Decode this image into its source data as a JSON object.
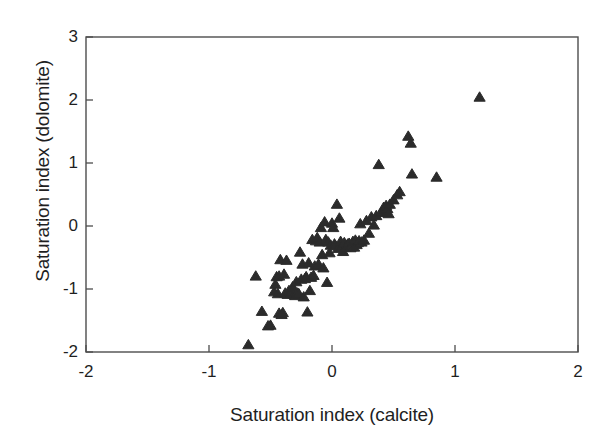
{
  "chart_data": {
    "type": "scatter",
    "title": "",
    "xlabel": "Saturation index (calcite)",
    "ylabel": "Saturation index (dolomite)",
    "xlim": [
      -2,
      2
    ],
    "ylim": [
      -2,
      3
    ],
    "xticks": [
      -2,
      -1,
      0,
      1,
      2
    ],
    "yticks": [
      -2,
      -1,
      0,
      1,
      2,
      3
    ],
    "xtick_labels": [
      "-2",
      "-1",
      "0",
      "1",
      "2"
    ],
    "ytick_labels": [
      "-2",
      "-1",
      "0",
      "1",
      "2",
      "3"
    ],
    "grid": false,
    "legend": null,
    "marker": "triangle-up",
    "marker_color": "#2b2b2b",
    "marker_size": 7,
    "frame": true,
    "series": [
      {
        "name": "samples",
        "points": [
          [
            -0.68,
            -1.88
          ],
          [
            -0.62,
            -0.79
          ],
          [
            -0.57,
            -1.35
          ],
          [
            -0.52,
            -1.58
          ],
          [
            -0.5,
            -1.57
          ],
          [
            -0.47,
            -1.04
          ],
          [
            -0.46,
            -0.92
          ],
          [
            -0.45,
            -0.8
          ],
          [
            -0.44,
            -1.07
          ],
          [
            -0.43,
            -0.79
          ],
          [
            -0.43,
            -1.38
          ],
          [
            -0.42,
            -0.53
          ],
          [
            -0.41,
            -1.4
          ],
          [
            -0.4,
            -1.37
          ],
          [
            -0.39,
            -0.76
          ],
          [
            -0.38,
            -1.06
          ],
          [
            -0.37,
            -0.54
          ],
          [
            -0.36,
            -1.08
          ],
          [
            -0.35,
            -1.02
          ],
          [
            -0.34,
            -1.04
          ],
          [
            -0.33,
            -1.05
          ],
          [
            -0.32,
            -0.96
          ],
          [
            -0.31,
            -1.08
          ],
          [
            -0.3,
            -1.1
          ],
          [
            -0.29,
            -0.88
          ],
          [
            -0.28,
            -1.06
          ],
          [
            -0.27,
            -1.07
          ],
          [
            -0.26,
            -0.41
          ],
          [
            -0.25,
            -0.84
          ],
          [
            -0.24,
            -0.6
          ],
          [
            -0.23,
            -1.12
          ],
          [
            -0.22,
            -0.83
          ],
          [
            -0.21,
            -0.8
          ],
          [
            -0.2,
            -1.36
          ],
          [
            -0.19,
            -0.58
          ],
          [
            -0.18,
            -1.02
          ],
          [
            -0.17,
            -0.81
          ],
          [
            -0.16,
            -0.21
          ],
          [
            -0.15,
            -0.78
          ],
          [
            -0.14,
            -0.63
          ],
          [
            -0.13,
            -0.23
          ],
          [
            -0.12,
            -0.18
          ],
          [
            -0.11,
            -0.6
          ],
          [
            -0.1,
            -0.25
          ],
          [
            -0.09,
            -0.02
          ],
          [
            -0.08,
            -0.45
          ],
          [
            -0.07,
            -0.66
          ],
          [
            -0.06,
            0.07
          ],
          [
            -0.05,
            -0.21
          ],
          [
            -0.04,
            -0.89
          ],
          [
            -0.03,
            -0.25
          ],
          [
            -0.02,
            -0.42
          ],
          [
            -0.01,
            -0.3
          ],
          [
            0.0,
            0.05
          ],
          [
            0.01,
            -0.02
          ],
          [
            0.02,
            -0.28
          ],
          [
            0.03,
            -0.31
          ],
          [
            0.04,
            0.35
          ],
          [
            0.05,
            -0.35
          ],
          [
            0.06,
            0.13
          ],
          [
            0.07,
            -0.24
          ],
          [
            0.08,
            -0.32
          ],
          [
            0.09,
            -0.4
          ],
          [
            0.1,
            -0.26
          ],
          [
            0.11,
            -0.33
          ],
          [
            0.12,
            -0.3
          ],
          [
            0.13,
            -0.28
          ],
          [
            0.14,
            -0.27
          ],
          [
            0.15,
            -0.34
          ],
          [
            0.16,
            -0.31
          ],
          [
            0.17,
            -0.24
          ],
          [
            0.18,
            -0.33
          ],
          [
            0.19,
            -0.22
          ],
          [
            0.2,
            -0.29
          ],
          [
            0.21,
            -0.26
          ],
          [
            0.22,
            -0.23
          ],
          [
            0.23,
            0.04
          ],
          [
            0.24,
            -0.25
          ],
          [
            0.26,
            -0.22
          ],
          [
            0.28,
            0.09
          ],
          [
            0.3,
            -0.11
          ],
          [
            0.32,
            0.15
          ],
          [
            0.34,
            0.02
          ],
          [
            0.36,
            0.17
          ],
          [
            0.38,
            0.98
          ],
          [
            0.4,
            0.22
          ],
          [
            0.42,
            0.3
          ],
          [
            0.43,
            0.26
          ],
          [
            0.44,
            0.33
          ],
          [
            0.45,
            0.28
          ],
          [
            0.46,
            0.2
          ],
          [
            0.47,
            0.35
          ],
          [
            0.5,
            0.42
          ],
          [
            0.53,
            0.5
          ],
          [
            0.55,
            0.55
          ],
          [
            0.62,
            1.43
          ],
          [
            0.64,
            1.32
          ],
          [
            0.65,
            0.83
          ],
          [
            0.85,
            0.78
          ],
          [
            1.2,
            2.05
          ]
        ]
      }
    ]
  },
  "axes": {
    "left_px": 86,
    "right_px": 578,
    "top_px": 37,
    "bottom_px": 352
  }
}
